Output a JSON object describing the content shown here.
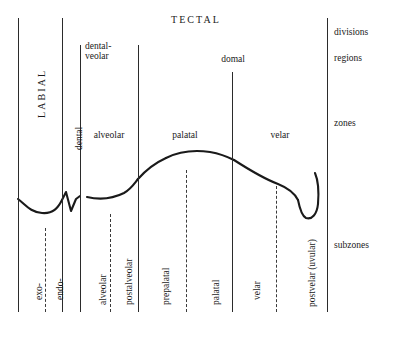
{
  "diagram": {
    "ink_color": "#2b2b2b",
    "background": "#ffffff"
  },
  "divisions": [
    {
      "label": "LABIAL",
      "orientation": "vertical"
    },
    {
      "label": "TECTAL",
      "orientation": "horizontal"
    }
  ],
  "regions": [
    {
      "label_line1": "dental-",
      "label_line2": "veolar"
    },
    {
      "label_line1": "domal",
      "label_line2": ""
    }
  ],
  "zones": [
    {
      "label": "dental",
      "orientation": "vertical"
    },
    {
      "label": "alveolar",
      "orientation": "horizontal"
    },
    {
      "label": "palatal",
      "orientation": "horizontal"
    },
    {
      "label": "velar",
      "orientation": "horizontal"
    }
  ],
  "subzones": [
    {
      "label": "exo-"
    },
    {
      "label": "endo-"
    },
    {
      "label": "alveolar"
    },
    {
      "label": "postalveolar"
    },
    {
      "label": "prepalatal"
    },
    {
      "label": "palatal"
    },
    {
      "label": "velar"
    },
    {
      "label": "postvelar (uvular)"
    }
  ],
  "legend": [
    {
      "label": "divisions"
    },
    {
      "label": "regions"
    },
    {
      "label": "zones"
    },
    {
      "label": "subzones"
    }
  ]
}
